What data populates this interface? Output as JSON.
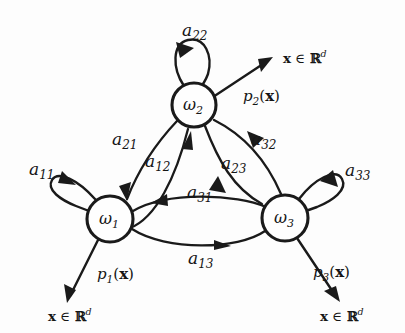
{
  "figure": {
    "type": "state-transition-diagram",
    "title": "",
    "background_color": "#fdfdfd",
    "stroke_color": "#1a1a1a"
  },
  "nodes": [
    {
      "id": "w1",
      "name": "omega",
      "sub": "1",
      "cx": 110,
      "cy": 219,
      "r": 23
    },
    {
      "id": "w2",
      "name": "omega",
      "sub": "2",
      "cx": 194,
      "cy": 105,
      "r": 22
    },
    {
      "id": "w3",
      "name": "omega",
      "sub": "3",
      "cx": 285,
      "cy": 218,
      "r": 23
    }
  ],
  "self_loops": [
    {
      "id": "a11",
      "name": "a",
      "sub": "11",
      "from": "w1",
      "to": "w1"
    },
    {
      "id": "a22",
      "name": "a",
      "sub": "22",
      "from": "w2",
      "to": "w2"
    },
    {
      "id": "a33",
      "name": "a",
      "sub": "33",
      "from": "w3",
      "to": "w3"
    }
  ],
  "transitions": [
    {
      "id": "a21",
      "name": "a",
      "sub": "21",
      "from": "w2",
      "to": "w1"
    },
    {
      "id": "a12",
      "name": "a",
      "sub": "12",
      "from": "w1",
      "to": "w2"
    },
    {
      "id": "a32",
      "name": "a",
      "sub": "32",
      "from": "w3",
      "to": "w2"
    },
    {
      "id": "a23",
      "name": "a",
      "sub": "23",
      "from": "w2",
      "to": "w3"
    },
    {
      "id": "a31",
      "name": "a",
      "sub": "31",
      "from": "w3",
      "to": "w1"
    },
    {
      "id": "a13",
      "name": "a",
      "sub": "13",
      "from": "w1",
      "to": "w3"
    }
  ],
  "emissions": [
    {
      "id": "p1",
      "name": "p",
      "sub": "1",
      "arg": "(x)",
      "from": "w1",
      "direction": "down-left",
      "target": "x-in-Rd"
    },
    {
      "id": "p2",
      "name": "p",
      "sub": "2",
      "arg": "(x)",
      "from": "w2",
      "direction": "up-right",
      "target": "x-in-Rd"
    },
    {
      "id": "p3",
      "name": "p",
      "sub": "3",
      "arg": "(x)",
      "from": "w3",
      "direction": "down-right",
      "target": "x-in-Rd"
    }
  ],
  "observation_label": {
    "variable": "x",
    "member_symbol": "∈",
    "space": "ℝ",
    "exponent": "d"
  },
  "icons": {
    "arrowhead": "arrowhead-icon",
    "state_circle": "state-circle-icon"
  }
}
